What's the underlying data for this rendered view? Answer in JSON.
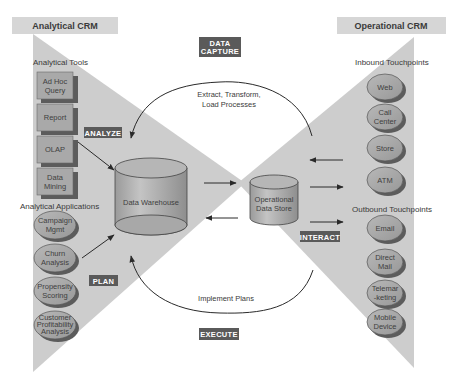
{
  "headers": {
    "analytical": "Analytical CRM",
    "operational": "Operational CRM"
  },
  "tags": {
    "data_capture": [
      "DATA",
      "CAPTURE"
    ],
    "analyze": "ANALYZE",
    "plan": "PLAN",
    "interact": "INTERACT",
    "execute": "EXECUTE"
  },
  "processes": {
    "etl": [
      "Extract, Transform,",
      "Load Processes"
    ],
    "implement": "Implement Plans"
  },
  "stores": {
    "warehouse": "Data Warehouse",
    "ods": [
      "Operational",
      "Data Store"
    ]
  },
  "analytical_tools": {
    "label": "Analytical Tools",
    "items": [
      [
        "Ad Hoc",
        "Query"
      ],
      [
        "Report"
      ],
      [
        "OLAP"
      ],
      [
        "Data",
        "Mining"
      ]
    ]
  },
  "analytical_applications": {
    "label": "Analytical Applications",
    "items": [
      [
        "Campaign",
        "Mgmt"
      ],
      [
        "Churn",
        "Analysis"
      ],
      [
        "Propensity",
        "Scoring"
      ],
      [
        "Customer",
        "Profitability",
        "Analysis"
      ]
    ]
  },
  "inbound": {
    "label": "Inbound Touchpoints",
    "items": [
      [
        "Web"
      ],
      [
        "Call",
        "Center"
      ],
      [
        "Store"
      ],
      [
        "ATM"
      ]
    ]
  },
  "outbound": {
    "label": "Outbound Touchpoints",
    "items": [
      [
        "Email"
      ],
      [
        "Direct",
        "Mail"
      ],
      [
        "Telemar",
        "-keting"
      ],
      [
        "Mobile",
        "Device"
      ]
    ]
  },
  "colors": {
    "band": "#cfcfcf",
    "header_bg": "#d8d8d8",
    "tag_bg": "#5a5a5a",
    "box_fill": "#a8a8a8",
    "box_shadow": "#5c5c5c",
    "cylinder": "#b4b4b4"
  }
}
